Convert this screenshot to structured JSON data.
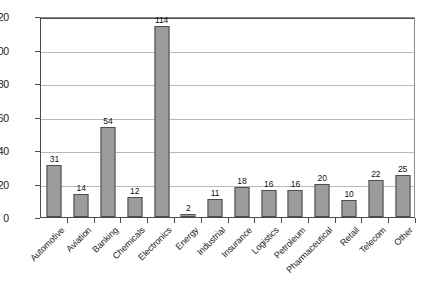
{
  "chart_data": {
    "type": "bar",
    "title": "",
    "subtitle": "",
    "xlabel": "",
    "ylabel": "",
    "categories": [
      "Automotive",
      "Aviation",
      "Banking",
      "Chemicals",
      "Electronics",
      "Energy",
      "Industrial",
      "Insurance",
      "Logistics",
      "Petroleum",
      "Pharmaceutical",
      "Retail",
      "Telecom",
      "Other"
    ],
    "values": [
      31,
      14,
      54,
      12,
      114,
      2,
      11,
      18,
      16,
      16,
      20,
      10,
      22,
      25
    ],
    "ylim": [
      0,
      120
    ],
    "ytick_step": 20,
    "ytick_labels": [
      "0",
      "20",
      "40",
      "60",
      "80",
      "100",
      "120"
    ],
    "grid": true,
    "grid_axis": "y",
    "legend": false,
    "legend_position": "none",
    "data_labels": true,
    "bar_color": "#9c9c9c",
    "bar_border_color": "#4d4d4d",
    "gridline_color": "#b9b9b9",
    "axis_color": "#4a4a4a",
    "background_color": "#ffffff",
    "xtick_label_rotation": -45
  }
}
